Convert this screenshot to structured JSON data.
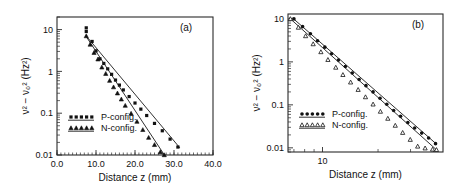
{
  "figure": {
    "background": "#ffffff",
    "foreground": "#111111",
    "width": 462,
    "height": 189
  },
  "chart_data": [
    {
      "type": "scatter",
      "panel_label": "(a)",
      "title": "",
      "xlabel": "Distance z  (mm)",
      "ylabel": "ν² − ν₀²  (Hz²)",
      "xscale": "linear",
      "yscale": "log",
      "xlim": [
        0.0,
        40.0
      ],
      "ylim": [
        0.01,
        20.0
      ],
      "xticks": [
        0.0,
        10.0,
        20.0,
        30.0,
        40.0
      ],
      "xticklabels": [
        "0.0",
        "10.0",
        "20.0",
        "30.0",
        "40.0"
      ],
      "yticks": [
        0.01,
        0.1,
        1,
        10
      ],
      "yticklabels": [
        "0.01",
        "0.1",
        "1",
        "10"
      ],
      "grid": false,
      "legend_position": "lower-left",
      "series": [
        {
          "name": "P-config.",
          "marker": "square-filled",
          "x": [
            7.5,
            7.5,
            9.0,
            10.0,
            11.0,
            12.0,
            13.0,
            14.0,
            15.0,
            16.0,
            17.0,
            18.5,
            20.0,
            21.5,
            23.0,
            25.0,
            27.0,
            29.0,
            31.0
          ],
          "y": [
            11.0,
            9.0,
            5.2,
            3.1,
            2.0,
            1.55,
            1.15,
            0.85,
            0.62,
            0.47,
            0.36,
            0.25,
            0.175,
            0.125,
            0.088,
            0.057,
            0.038,
            0.024,
            0.0155
          ],
          "fit": {
            "x0": 7.4,
            "y0": 7.2,
            "x1": 31.5,
            "y1": 0.0148
          }
        },
        {
          "name": "N-config.",
          "marker": "triangle-filled",
          "x": [
            7.5,
            8.5,
            9.5,
            10.5,
            11.5,
            12.5,
            13.5,
            14.5,
            15.5,
            16.5,
            17.5,
            19.0,
            20.5,
            22.0,
            23.5,
            25.0,
            26.5,
            27.5
          ],
          "y": [
            7.0,
            4.4,
            2.8,
            1.95,
            1.25,
            0.88,
            0.6,
            0.42,
            0.3,
            0.215,
            0.152,
            0.098,
            0.063,
            0.04,
            0.026,
            0.0175,
            0.0118,
            0.01
          ],
          "fit": {
            "x0": 7.4,
            "y0": 7.0,
            "x1": 27.6,
            "y1": 0.0098
          }
        }
      ]
    },
    {
      "type": "scatter",
      "panel_label": "(b)",
      "title": "",
      "xlabel": "Distance z  (mm)",
      "ylabel": "ν² − ν₀²  (Hz²)",
      "xscale": "log",
      "yscale": "log",
      "xlim": [
        6.5,
        45.0
      ],
      "ylim": [
        0.008,
        13.0
      ],
      "xticks": [
        10
      ],
      "xticklabels": [
        "10"
      ],
      "yticks": [
        0.01,
        0.1,
        1,
        10
      ],
      "yticklabels": [
        "0.01",
        "0.1",
        "1",
        "10"
      ],
      "grid": false,
      "legend_position": "lower-left",
      "series": [
        {
          "name": "P-config.",
          "marker": "dot-filled",
          "x": [
            7.0,
            7.8,
            8.6,
            9.4,
            10.3,
            11.2,
            12.2,
            13.3,
            14.5,
            15.8,
            17.2,
            18.8,
            20.5,
            22.3,
            24.3,
            26.5,
            29.0,
            31.6,
            34.5,
            37.6,
            41.0
          ],
          "y": [
            10.0,
            6.6,
            4.5,
            3.1,
            2.2,
            1.55,
            1.1,
            0.78,
            0.55,
            0.39,
            0.28,
            0.2,
            0.143,
            0.103,
            0.074,
            0.054,
            0.039,
            0.029,
            0.022,
            0.017,
            0.0125
          ],
          "fit": {
            "x0": 6.9,
            "y0": 10.4,
            "x1": 41.5,
            "y1": 0.0122
          }
        },
        {
          "name": "N-config.",
          "marker": "triangle-open",
          "x": [
            6.7,
            7.4,
            8.1,
            8.9,
            9.8,
            10.7,
            11.8,
            12.9,
            14.2,
            15.6,
            17.1,
            18.8,
            20.6,
            22.6,
            24.8,
            27.2,
            29.9,
            32.8,
            36.0,
            39.5,
            41.5
          ],
          "y": [
            10.0,
            6.3,
            4.0,
            2.6,
            1.7,
            1.12,
            0.74,
            0.5,
            0.335,
            0.225,
            0.152,
            0.103,
            0.07,
            0.048,
            0.033,
            0.0225,
            0.0155,
            0.0108,
            0.0098,
            0.0092,
            0.009
          ],
          "fit": {
            "x0": 6.6,
            "y0": 10.6,
            "x1": 41.6,
            "y1": 0.0089
          }
        }
      ]
    }
  ]
}
